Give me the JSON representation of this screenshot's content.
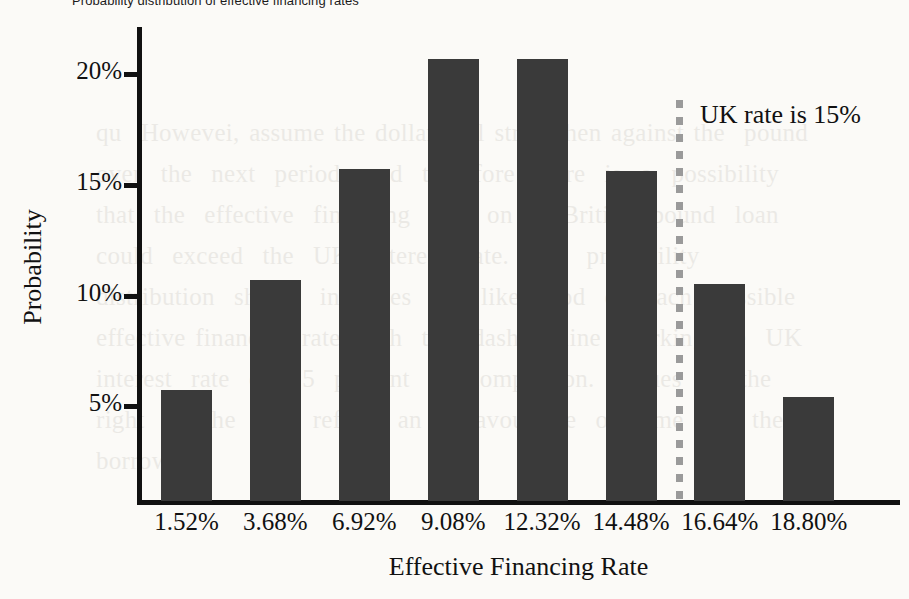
{
  "chart_data": {
    "type": "bar",
    "title": "Probability distribution of effective financing rates",
    "xlabel": "Effective Financing Rate",
    "ylabel": "Probability",
    "categories": [
      "1.52%",
      "3.68%",
      "6.92%",
      "9.08%",
      "12.32%",
      "14.48%",
      "16.64%",
      "18.80%"
    ],
    "values": [
      5.0,
      10.0,
      15.0,
      20.0,
      20.0,
      14.9,
      9.8,
      4.7
    ],
    "ytick_labels": [
      "20%",
      "15%",
      "10%",
      "5%"
    ],
    "ytick_values": [
      20,
      15,
      10,
      5
    ],
    "ylim": [
      0,
      22.3
    ],
    "grid": false,
    "legend": false,
    "bar_color": "#3a3a3a",
    "annotations": [
      {
        "label": "UK rate is 15%",
        "x_value": 15.0,
        "line_color": "#9a9a9a",
        "line_style": "dashed"
      }
    ]
  },
  "background_text": "qu  Howevei, assume the dollar will strengthen against the  pound over  the  next  period,  and  therefore  there  is  a  possibility  that  the  effective  financing  rate  on  a  British  pound  loan  could  exceed  the  UK  interest  rate.  The  probability  distribution  shown  indicates  the  likelihood  of  each  possible  effective financing rate, with  the  dashed  line  marking the  UK  interest  rate  of  15  percent  for comparison.  Values  to  the  right  of  the  line  reflect  an  unfavourable  outcome  for  the  borrower."
}
